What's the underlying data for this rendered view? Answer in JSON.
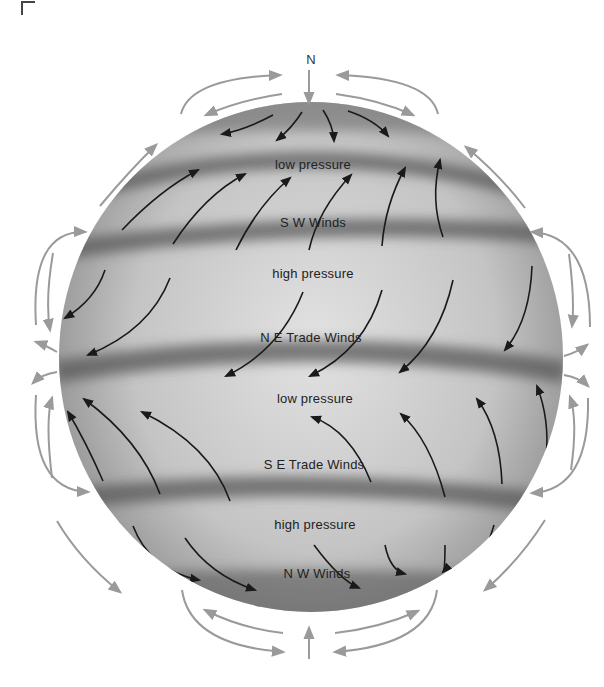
{
  "diagram": {
    "north_label": "N",
    "colors": {
      "sphere_light": "#d9d9d9",
      "sphere_dark": "#6e6e6e",
      "band_shadow": "#5a5a5a",
      "surface_arrow": "#1a1a1a",
      "air_arrow": "#9a9a9a"
    },
    "belts": [
      {
        "id": "polar-low-north",
        "label": "low pressure",
        "type": "pressure"
      },
      {
        "id": "sw-winds",
        "label": "S W Winds",
        "type": "wind"
      },
      {
        "id": "subtropical-high-north",
        "label": "high pressure",
        "type": "pressure"
      },
      {
        "id": "ne-trade-winds",
        "label": "N E Trade Winds",
        "type": "wind"
      },
      {
        "id": "equatorial-low",
        "label": "low pressure",
        "type": "pressure"
      },
      {
        "id": "se-trade-winds",
        "label": "S E Trade Winds",
        "type": "wind"
      },
      {
        "id": "subtropical-high-south",
        "label": "high pressure",
        "type": "pressure"
      },
      {
        "id": "nw-winds",
        "label": "N W Winds",
        "type": "wind"
      }
    ]
  }
}
